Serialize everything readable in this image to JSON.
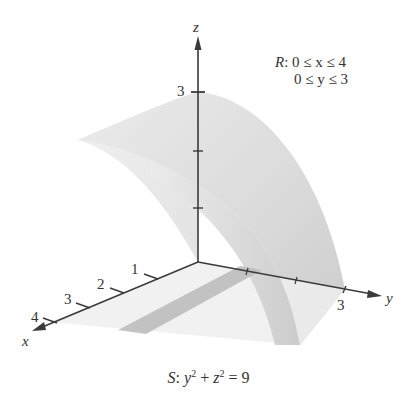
{
  "figure": {
    "axes": {
      "x": {
        "label": "x",
        "ticks": [
          "1",
          "2",
          "3",
          "4"
        ]
      },
      "y": {
        "label": "y",
        "ticks": [
          "3"
        ]
      },
      "z": {
        "label": "z",
        "ticks": [
          "3"
        ]
      }
    },
    "region": {
      "name": "R",
      "line1": "0 ≤ x ≤ 4",
      "line2": "0 ≤ y ≤ 3"
    },
    "surface": {
      "name": "S",
      "lhs_y": "y",
      "lhs_z": "z",
      "exp": "2",
      "rhs": "= 9"
    },
    "colors": {
      "surface_light": "#ececec",
      "surface_mid": "#dcdcdc",
      "surface_dark": "#c4c4c4",
      "floor_strip": "#b9b9b9",
      "axis": "#3a3a3a"
    }
  }
}
